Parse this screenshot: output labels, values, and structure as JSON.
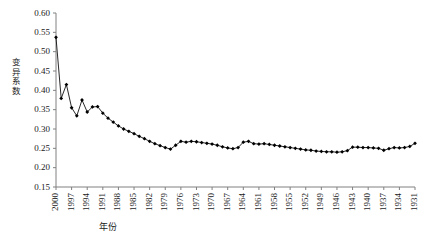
{
  "chart_data": {
    "type": "line",
    "title": "",
    "xlabel": "年份",
    "ylabel": "变异系数",
    "ylim": [
      0.15,
      0.6
    ],
    "ytick_step": 0.05,
    "yticks": [
      "0.60",
      "0.55",
      "0.50",
      "0.45",
      "0.40",
      "0.35",
      "0.30",
      "0.25",
      "0.20",
      "0.15"
    ],
    "xlim": [
      2000,
      1931
    ],
    "x_direction": "descending",
    "xticks": [
      "2000",
      "1997",
      "1994",
      "1991",
      "1988",
      "1985",
      "1982",
      "1979",
      "1976",
      "1973",
      "1970",
      "1967",
      "1964",
      "1961",
      "1958",
      "1955",
      "1952",
      "1949",
      "1946",
      "1943",
      "1940",
      "1937",
      "1934",
      "1931"
    ],
    "xtick_step": 3,
    "grid": false,
    "legend": null,
    "marker": "filled-diamond",
    "line_color": "#111111",
    "marker_color": "#000000",
    "axis_color": "#808080",
    "categories": [
      2000,
      1999,
      1998,
      1997,
      1996,
      1995,
      1994,
      1993,
      1992,
      1991,
      1990,
      1989,
      1988,
      1987,
      1986,
      1985,
      1984,
      1983,
      1982,
      1981,
      1980,
      1979,
      1978,
      1977,
      1976,
      1975,
      1974,
      1973,
      1972,
      1971,
      1970,
      1969,
      1968,
      1967,
      1966,
      1965,
      1964,
      1963,
      1962,
      1961,
      1960,
      1959,
      1958,
      1957,
      1956,
      1955,
      1954,
      1953,
      1952,
      1951,
      1950,
      1949,
      1948,
      1947,
      1946,
      1945,
      1944,
      1943,
      1942,
      1941,
      1940,
      1939,
      1938,
      1937,
      1936,
      1935,
      1934,
      1933,
      1932,
      1931
    ],
    "values": [
      0.537,
      0.379,
      0.415,
      0.355,
      0.334,
      0.375,
      0.344,
      0.357,
      0.358,
      0.341,
      0.328,
      0.318,
      0.308,
      0.3,
      0.294,
      0.288,
      0.281,
      0.275,
      0.268,
      0.262,
      0.257,
      0.252,
      0.248,
      0.258,
      0.268,
      0.266,
      0.268,
      0.267,
      0.265,
      0.263,
      0.261,
      0.258,
      0.254,
      0.251,
      0.249,
      0.252,
      0.266,
      0.268,
      0.262,
      0.261,
      0.262,
      0.26,
      0.258,
      0.256,
      0.254,
      0.252,
      0.25,
      0.248,
      0.246,
      0.245,
      0.243,
      0.242,
      0.241,
      0.241,
      0.24,
      0.241,
      0.244,
      0.253,
      0.253,
      0.252,
      0.252,
      0.251,
      0.25,
      0.245,
      0.249,
      0.252,
      0.251,
      0.252,
      0.255,
      0.263
    ]
  },
  "plot_geometry": {
    "left": 56,
    "right": 415,
    "top": 13,
    "bottom": 187
  }
}
